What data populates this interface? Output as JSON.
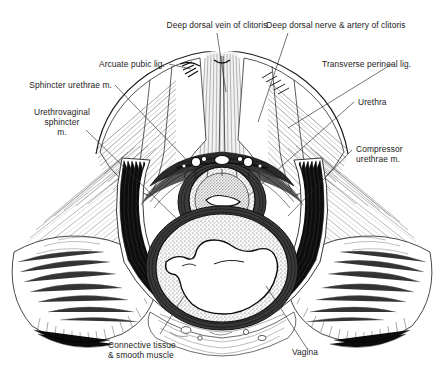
{
  "figure": {
    "background_color": "#ffffff",
    "ink_color": "#1b1b1b",
    "leader_color": "#2a2a2a",
    "width": 444,
    "height": 376
  },
  "labels": {
    "deep_dorsal_vein": "Deep dorsal vein of clitoris",
    "deep_dorsal_nerve_artery": "Deep dorsal nerve & artery of clitoris",
    "arcuate_pubic_lig": "Arcuate pubic lig.",
    "transverse_perineal_lig": "Transverse perineal lig.",
    "sphincter_urethrae": "Sphincter urethrae m.",
    "urethra": "Urethra",
    "urethrovaginal_l1": "Urethrovaginal",
    "urethrovaginal_l2": "sphincter",
    "urethrovaginal_l3": "m.",
    "compressor_l1": "Compressor",
    "compressor_l2": "urethrae m.",
    "connective_l1": "Connective tissue",
    "connective_l2": "& smooth muscle",
    "vagina": "Vagina"
  }
}
